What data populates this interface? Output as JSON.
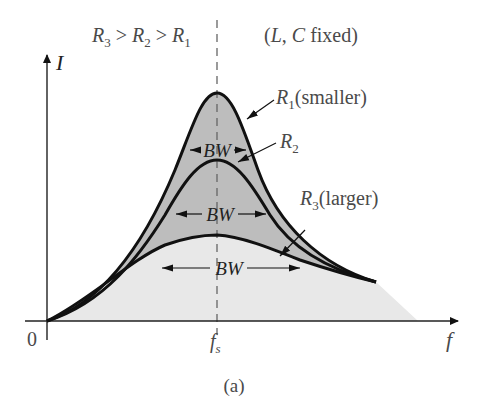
{
  "figure": {
    "caption": "(a)",
    "header_condition": {
      "R3": "R",
      "R3_sub": "3",
      "gt1": " > ",
      "R2": "R",
      "R2_sub": "2",
      "gt2": " > ",
      "R1": "R",
      "R1_sub": "1"
    },
    "fixed_note": {
      "open": "(",
      "L": "L",
      "comma": ", ",
      "C": "C",
      "rest": " fixed)"
    }
  },
  "axes": {
    "y_label": "I",
    "x_label": "f",
    "origin_label": "0",
    "center_label": "f",
    "center_label_sub": "s"
  },
  "curves": [
    {
      "name": "R1",
      "label": "R",
      "sub": "1",
      "suffix": "(smaller)",
      "bw_label": "BW",
      "relative_peak": 1.0
    },
    {
      "name": "R2",
      "label": "R",
      "sub": "2",
      "suffix": "",
      "bw_label": "BW",
      "relative_peak": 0.71
    },
    {
      "name": "R3",
      "label": "R",
      "sub": "3",
      "suffix": "(larger)",
      "bw_label": "BW",
      "relative_peak": 0.37
    }
  ],
  "colors": {
    "curve_stroke": "#111111",
    "fill_dark": "#b8b8b8",
    "fill_light": "#e6e6e6",
    "axis": "#333333",
    "dashed": "#666666"
  }
}
